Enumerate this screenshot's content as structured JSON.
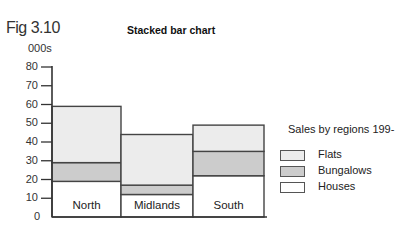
{
  "figure": {
    "label": "Fig 3.10",
    "title": "Stacked bar chart",
    "unit_label": "000s"
  },
  "legend": {
    "title": "Sales by regions 199-",
    "items": [
      {
        "label": "Flats",
        "color": "#ececec"
      },
      {
        "label": "Bungalows",
        "color": "#cccccc"
      },
      {
        "label": "Houses",
        "color": "#ffffff"
      }
    ]
  },
  "chart_data": {
    "type": "bar",
    "stacked": true,
    "title": "Stacked bar chart",
    "subtitle": "Fig 3.10",
    "xlabel": "",
    "ylabel": "000s",
    "ylim": [
      0,
      80
    ],
    "yticks": [
      0,
      10,
      20,
      30,
      40,
      50,
      60,
      70,
      80
    ],
    "grid": false,
    "legend_position": "right",
    "legend_title": "Sales by regions 199-",
    "categories": [
      "North",
      "Midlands",
      "South"
    ],
    "series": [
      {
        "name": "Houses",
        "values": [
          19,
          12,
          22
        ],
        "color": "#ffffff"
      },
      {
        "name": "Bungalows",
        "values": [
          10,
          5,
          13
        ],
        "color": "#cccccc"
      },
      {
        "name": "Flats",
        "values": [
          30,
          27,
          14
        ],
        "color": "#ececec"
      }
    ],
    "totals": [
      59,
      44,
      49
    ]
  }
}
